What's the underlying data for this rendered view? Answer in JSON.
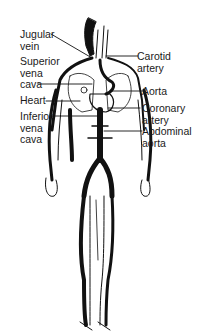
{
  "diagram": {
    "colors": {
      "ink": "#111111",
      "background": "#ffffff"
    },
    "labels_left": [
      {
        "id": "jugular-vein",
        "text": "Jugular\nvein"
      },
      {
        "id": "superior-vena-cava",
        "text": "Superior\nvena\ncava"
      },
      {
        "id": "heart",
        "text": "Heart"
      },
      {
        "id": "inferior-vena-cava",
        "text": "Inferior\nvena\ncava"
      }
    ],
    "labels_right": [
      {
        "id": "carotid-artery",
        "text": "Carotid\nartery"
      },
      {
        "id": "aorta",
        "text": "Aorta"
      },
      {
        "id": "coronary-artery",
        "text": "Coronary\nartery"
      },
      {
        "id": "abdominal-aorta",
        "text": "Abdominal\naorta"
      }
    ]
  }
}
